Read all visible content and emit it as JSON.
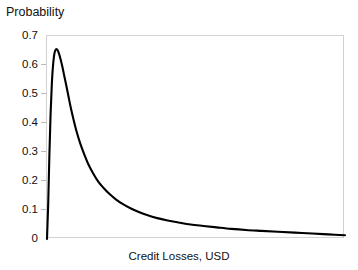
{
  "chart_data": {
    "type": "line",
    "title": "",
    "xlabel": "Credit Losses, USD",
    "ylabel": "Probability",
    "ylim": [
      0,
      0.7
    ],
    "xlim": [
      0,
      1
    ],
    "grid": false,
    "legend": null,
    "ytick_labels": [
      "0.7",
      "0.6",
      "0.5",
      "0.4",
      "0.3",
      "0.2",
      "0.1",
      "0"
    ],
    "ytick_values": [
      0.7,
      0.6,
      0.5,
      0.4,
      0.3,
      0.2,
      0.1,
      0
    ],
    "xtick_labels": [],
    "curve_color": "#000000",
    "frame_color": "#d2d2d2",
    "annotations": [],
    "series": [
      {
        "name": "Credit loss probability density",
        "x": [
          0.0,
          0.004,
          0.008,
          0.012,
          0.016,
          0.02,
          0.025,
          0.03,
          0.035,
          0.04,
          0.046,
          0.052,
          0.058,
          0.065,
          0.072,
          0.08,
          0.09,
          0.1,
          0.112,
          0.125,
          0.14,
          0.155,
          0.172,
          0.19,
          0.21,
          0.232,
          0.255,
          0.28,
          0.308,
          0.338,
          0.37,
          0.405,
          0.442,
          0.482,
          0.525,
          0.57,
          0.618,
          0.668,
          0.72,
          0.775,
          0.832,
          0.89,
          0.945,
          1.0
        ],
        "y": [
          0.0,
          0.12,
          0.29,
          0.43,
          0.53,
          0.595,
          0.64,
          0.654,
          0.652,
          0.64,
          0.618,
          0.592,
          0.562,
          0.528,
          0.492,
          0.452,
          0.408,
          0.368,
          0.328,
          0.292,
          0.255,
          0.226,
          0.198,
          0.176,
          0.155,
          0.136,
          0.12,
          0.106,
          0.093,
          0.082,
          0.072,
          0.064,
          0.057,
          0.05,
          0.045,
          0.04,
          0.035,
          0.031,
          0.028,
          0.025,
          0.022,
          0.019,
          0.016,
          0.013
        ]
      }
    ],
    "peak": {
      "x": 0.03,
      "y": 0.655
    }
  },
  "axes": {
    "ylabel": "Probability",
    "xlabel": "Credit Losses, USD"
  }
}
